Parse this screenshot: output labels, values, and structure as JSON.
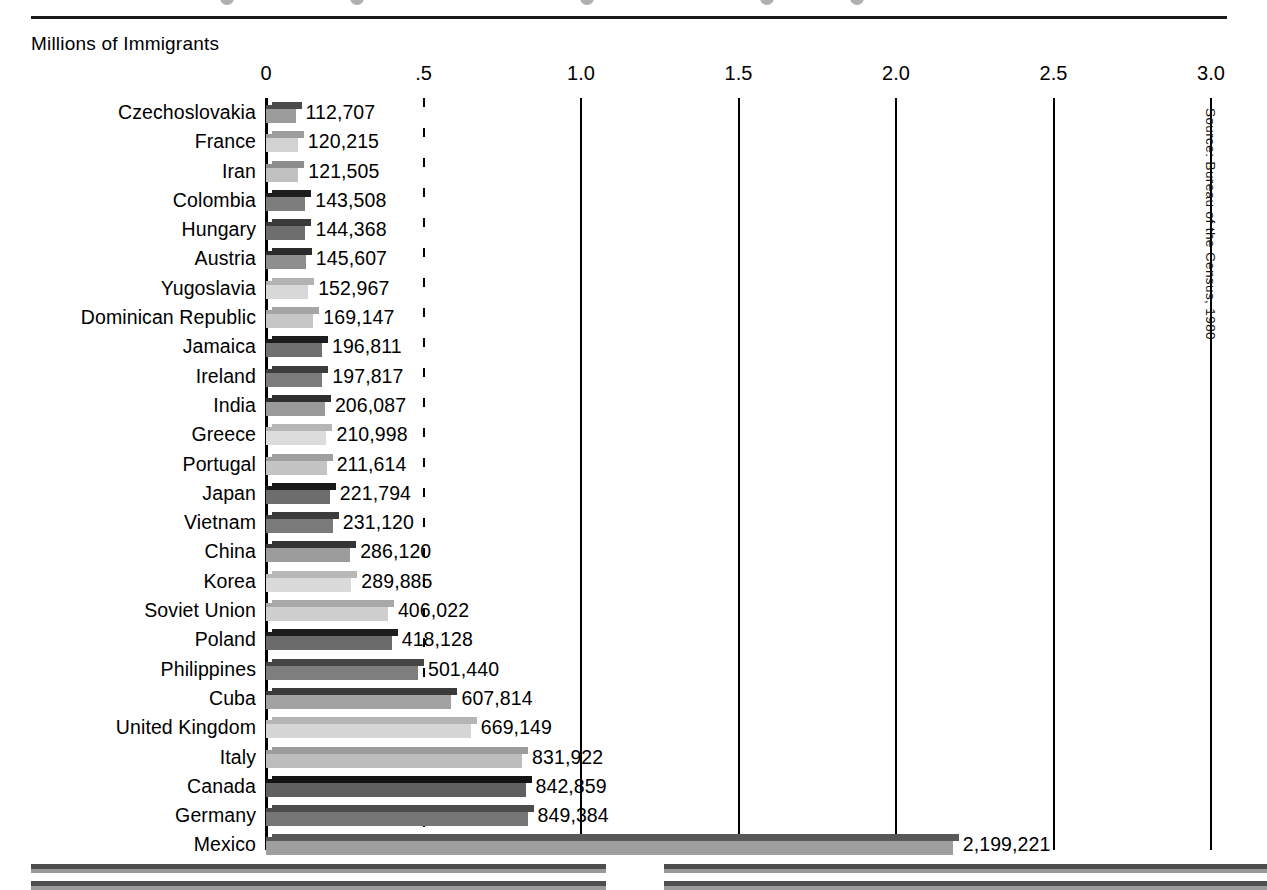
{
  "header": {
    "axis_caption": "Millions of Immigrants",
    "rule": "horizontal-rule"
  },
  "source_note": "Source: Bureau of the Census, 1980",
  "chart_data": {
    "type": "bar",
    "orientation": "horizontal",
    "title": "",
    "subtitle": "",
    "xlabel": "Millions of Immigrants",
    "ylabel": "",
    "xlim": [
      0,
      3.0
    ],
    "grid": true,
    "legend": "none",
    "tick_labels": [
      "0",
      ".5",
      "1.0",
      "1.5",
      "2.0",
      "2.5",
      "3.0"
    ],
    "tick_values": [
      0,
      0.5,
      1.0,
      1.5,
      2.0,
      2.5,
      3.0
    ],
    "units": "millions",
    "categories": [
      "Czechoslovakia",
      "France",
      "Iran",
      "Colombia",
      "Hungary",
      "Austria",
      "Yugoslavia",
      "Dominican Republic",
      "Jamaica",
      "Ireland",
      "India",
      "Greece",
      "Portugal",
      "Japan",
      "Vietnam",
      "China",
      "Korea",
      "Soviet Union",
      "Poland",
      "Philippines",
      "Cuba",
      "United Kingdom",
      "Italy",
      "Canada",
      "Germany",
      "Mexico"
    ],
    "values": [
      112707,
      120215,
      121505,
      143508,
      144368,
      145607,
      152967,
      169147,
      196811,
      197817,
      206087,
      210998,
      211614,
      221794,
      231120,
      286120,
      289885,
      406022,
      418128,
      501440,
      607814,
      669149,
      831922,
      842859,
      849384,
      2199221
    ],
    "value_labels": [
      "112,707",
      "120,215",
      "121,505",
      "143,508",
      "144,368",
      "145,607",
      "152,967",
      "169,147",
      "196,811",
      "197,817",
      "206,087",
      "210,998",
      "211,614",
      "221,794",
      "231,120",
      "286,120",
      "289,885",
      "406,022",
      "418,128",
      "501,440",
      "607,814",
      "669,149",
      "831,922",
      "842,859",
      "849,384",
      "2,199,221"
    ],
    "bar_shades": [
      {
        "cap": "#4a4a4a",
        "face": "#9b9b9b"
      },
      {
        "cap": "#9d9d9d",
        "face": "#d2d2d2"
      },
      {
        "cap": "#8d8d8d",
        "face": "#c0c0c0"
      },
      {
        "cap": "#1e1e1e",
        "face": "#7d7d7d"
      },
      {
        "cap": "#3a3a3a",
        "face": "#6e6e6e"
      },
      {
        "cap": "#2b2b2b",
        "face": "#8e8e8e"
      },
      {
        "cap": "#b3b3b3",
        "face": "#d8d8d8"
      },
      {
        "cap": "#a5a5a5",
        "face": "#c6c6c6"
      },
      {
        "cap": "#1c1c1c",
        "face": "#707070"
      },
      {
        "cap": "#3d3d3d",
        "face": "#7c7c7c"
      },
      {
        "cap": "#2f2f2f",
        "face": "#9a9a9a"
      },
      {
        "cap": "#b6b6b6",
        "face": "#dcdcdc"
      },
      {
        "cap": "#a0a0a0",
        "face": "#c4c4c4"
      },
      {
        "cap": "#1a1a1a",
        "face": "#6d6d6d"
      },
      {
        "cap": "#3c3c3c",
        "face": "#7a7a7a"
      },
      {
        "cap": "#343434",
        "face": "#9c9c9c"
      },
      {
        "cap": "#b8b8b8",
        "face": "#dadada"
      },
      {
        "cap": "#a8a8a8",
        "face": "#cfcfcf"
      },
      {
        "cap": "#1d1d1d",
        "face": "#6b6b6b"
      },
      {
        "cap": "#454545",
        "face": "#7e7e7e"
      },
      {
        "cap": "#3a3a3a",
        "face": "#a2a2a2"
      },
      {
        "cap": "#b5b5b5",
        "face": "#d6d6d6"
      },
      {
        "cap": "#9c9c9c",
        "face": "#bdbdbd"
      },
      {
        "cap": "#141414",
        "face": "#606060"
      },
      {
        "cap": "#4b4b4b",
        "face": "#767676"
      },
      {
        "cap": "#585858",
        "face": "#9f9f9f"
      }
    ]
  },
  "bottom_bleed": {
    "label": "partial-bars-from-figure-below",
    "stripes": [
      {
        "left": 31,
        "width": 575,
        "top": 16
      },
      {
        "left": 664,
        "width": 603,
        "top": 16
      },
      {
        "left": 31,
        "width": 575,
        "top": 33
      },
      {
        "left": 664,
        "width": 603,
        "top": 33
      }
    ],
    "dark": "#4e4e4e",
    "light": "#9a9a9a"
  }
}
